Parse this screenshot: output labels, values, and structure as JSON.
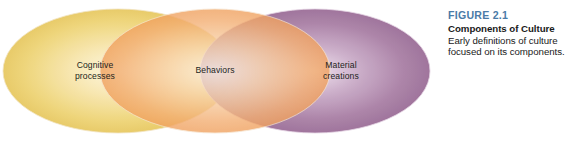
{
  "figure": {
    "number_label": "FIGURE 2.1",
    "title": "Components of Culture",
    "description": "Early definitions of culture focused on its components.",
    "number_color": "#4a7ba7",
    "text_color": "#1a1a1a"
  },
  "diagram": {
    "type": "venn",
    "label_color": "#231f20",
    "outline_color": "#f3e6d2",
    "ellipses": [
      {
        "name": "cognitive-processes",
        "label": "Cognitive\nprocesses",
        "color": "#e8c85c",
        "highlight_color": "#fdf6dd",
        "edge_color": "#d9ad3a",
        "cx": 118,
        "cy": 71,
        "rx": 115,
        "ry": 62
      },
      {
        "name": "behaviors",
        "label": "Behaviors",
        "color": "#f0a35e",
        "highlight_color": "#fdf0e3",
        "edge_color": "#e28b3e",
        "cx": 215,
        "cy": 71,
        "rx": 115,
        "ry": 62
      },
      {
        "name": "material-creations",
        "label": "Material\ncreations",
        "color": "#9a6a96",
        "highlight_color": "#e8d6e6",
        "edge_color": "#835482",
        "cx": 315,
        "cy": 71,
        "rx": 115,
        "ry": 62
      }
    ]
  }
}
